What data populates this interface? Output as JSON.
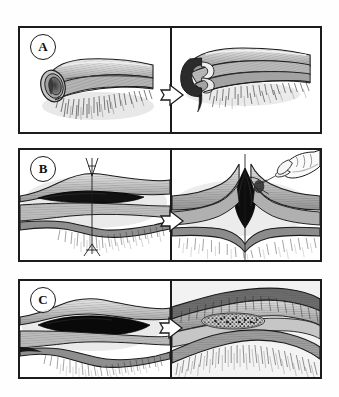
{
  "figure": {
    "style": "grayscale pen-and-ink anatomical line drawing",
    "background_color": "#ffffff",
    "border_color": "#1b1b1b",
    "panel_count": 3
  },
  "panels": [
    {
      "label": "A",
      "label_shape": "circle",
      "left": {
        "caption": "",
        "subject": "intact tubular graft segment with open lumen end and fine fibrous strands beneath"
      },
      "transition_icon": "block-arrow-right",
      "right": {
        "caption": "",
        "subject": "longitudinally incised tubular graft opened to expose the inner layers"
      }
    },
    {
      "label": "B",
      "label_shape": "circle",
      "left": {
        "caption": "",
        "subject": "closed linear wound in tissue cross-section with a vertical suture passed through, needle above and thread tails below"
      },
      "transition_icon": "block-arrow-right",
      "right": {
        "caption": "",
        "subject": "hand tensioning the suture, tenting the tissue and opening a diamond-shaped wound cavity"
      }
    },
    {
      "label": "C",
      "label_shape": "circle",
      "left": {
        "caption": "",
        "subject": "tissue cross-section with a dark elliptical open wound and fibrous deep layer"
      },
      "transition_icon": "block-arrow-right",
      "right": {
        "caption": "",
        "subject": "magnified view of the wound bed filled with granular packing material within the surrounding tissue layers"
      }
    }
  ],
  "colors": {
    "ink": "#1b1b1b",
    "mid_gray": "#9a9a9a",
    "light_gray": "#c9c9c9",
    "pale_gray": "#e2e2e2",
    "shadow": "#6e6e6e",
    "deep_black": "#0d0d0d",
    "paper": "#ffffff"
  },
  "arrow": {
    "name": "block-arrow-right",
    "fill": "#ffffff",
    "stroke": "#1b1b1b",
    "direction": "right"
  }
}
